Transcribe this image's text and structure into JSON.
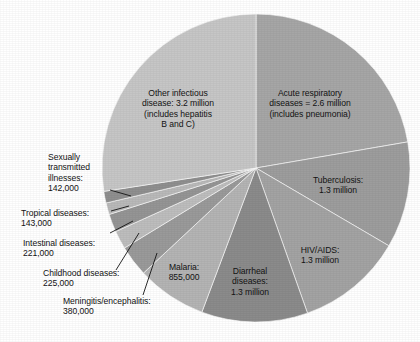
{
  "figure": {
    "kind": "pie-chart",
    "background_color": "#ffffff",
    "text_color": "#131313",
    "center": {
      "x": 256,
      "y": 168
    },
    "radius": 154
  },
  "chart_data": {
    "type": "pie",
    "title": "",
    "subtitle": "",
    "xlabel": "",
    "ylabel": "",
    "legend_position": "none",
    "grid": false,
    "units": "deaths per year",
    "total": 10366000,
    "start_angle_deg": 0,
    "direction": "clockwise",
    "categories": [
      "Acute respiratory diseases",
      "Tuberculosis",
      "HIV/AIDS",
      "Diarrheal diseases",
      "Malaria",
      "Meningitis/encephalitis",
      "Childhood diseases",
      "Intestinal diseases",
      "Tropical diseases",
      "Sexually transmitted illnesses",
      "Other infectious disease"
    ],
    "values": [
      2600000,
      1300000,
      1300000,
      1300000,
      855000,
      380000,
      225000,
      221000,
      143000,
      142000,
      3200000
    ],
    "slices": [
      {
        "name": "acute-respiratory-diseases",
        "label": "Acute respiratory\ndiseases = 2.6 million\n(includes pneumonia)",
        "value": 2600000,
        "value_text": "2.6 million",
        "color": "#a6a6a6",
        "label_placement": "inside",
        "label_x": 310,
        "label_y": 88
      },
      {
        "name": "tuberculosis",
        "label": "Tuberculosis:\n1.3 million",
        "value": 1300000,
        "value_text": "1.3 million",
        "color": "#9d9d9d",
        "label_placement": "inside",
        "label_x": 338,
        "label_y": 175
      },
      {
        "name": "hiv-aids",
        "label": "HIV/AIDS:\n1.3 million",
        "value": 1300000,
        "value_text": "1.3 million",
        "color": "#a3a3a3",
        "label_placement": "inside",
        "label_x": 320,
        "label_y": 245
      },
      {
        "name": "diarrheal-diseases",
        "label": "Diarrheal\ndiseases:\n1.3 million",
        "value": 1300000,
        "value_text": "1.3 million",
        "color": "#8b8b8b",
        "label_placement": "inside",
        "label_x": 250,
        "label_y": 266
      },
      {
        "name": "malaria",
        "label": "Malaria:\n855,000",
        "value": 855000,
        "value_text": "855,000",
        "color": "#b4b4b4",
        "label_placement": "inside",
        "label_x": 184,
        "label_y": 262
      },
      {
        "name": "meningitis-encephalitis",
        "label": "Meningitis/encephalitis:\n380,000",
        "value": 380000,
        "value_text": "380,000",
        "color": "#9a9a9a",
        "label_placement": "outside",
        "label_x": 63,
        "label_y": 296
      },
      {
        "name": "childhood-diseases",
        "label": "Childhood diseases:\n225,000",
        "value": 225000,
        "value_text": "225,000",
        "color": "#bdbdbd",
        "label_placement": "outside",
        "label_x": 43,
        "label_y": 268
      },
      {
        "name": "intestinal-diseases",
        "label": "Intestinal diseases:\n221,000",
        "value": 221000,
        "value_text": "221,000",
        "color": "#959595",
        "label_placement": "outside",
        "label_x": 23,
        "label_y": 238
      },
      {
        "name": "tropical-diseases",
        "label": "Tropical diseases:\n143,000",
        "value": 143000,
        "value_text": "143,000",
        "color": "#b9b9b9",
        "label_placement": "outside",
        "label_x": 21,
        "label_y": 208
      },
      {
        "name": "sexually-transmitted-illnesses",
        "label": "Sexually\ntransmitted\nillnesses:\n142,000",
        "value": 142000,
        "value_text": "142,000",
        "color": "#8f8f8f",
        "label_placement": "outside",
        "label_x": 48,
        "label_y": 152
      },
      {
        "name": "other-infectious-disease",
        "label": "Other infectious\ndisease: 3.2 million\n(includes hepatitis\nB and C)",
        "value": 3200000,
        "value_text": "3.2 million",
        "color": "#c6c6c6",
        "label_placement": "inside",
        "label_x": 178,
        "label_y": 88
      }
    ],
    "leader_lines": [
      {
        "name": "leader-sexually-transmitted",
        "x1": 110,
        "y1": 190,
        "x2": 131,
        "y2": 196
      },
      {
        "name": "leader-tropical-diseases",
        "x1": 111,
        "y1": 211,
        "x2": 129,
        "y2": 206
      },
      {
        "name": "leader-intestinal-diseases",
        "x1": 110,
        "y1": 233,
        "x2": 133,
        "y2": 221
      },
      {
        "name": "leader-childhood-diseases",
        "x1": 116,
        "y1": 270,
        "x2": 139,
        "y2": 233
      },
      {
        "name": "leader-meningitis",
        "x1": 143,
        "y1": 295,
        "x2": 157,
        "y2": 253
      }
    ]
  }
}
